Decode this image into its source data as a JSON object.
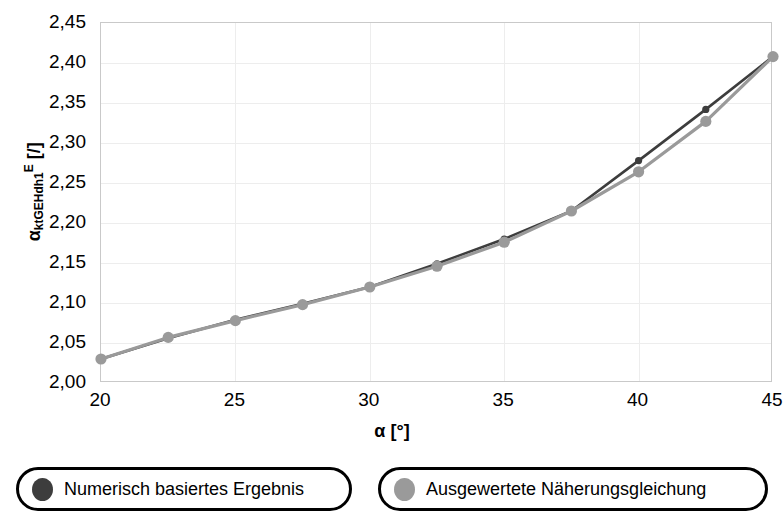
{
  "chart_data": {
    "type": "line",
    "title": "",
    "xlabel": "α [°]",
    "ylabel": "α_ktGEHdh1^E [/]",
    "ylabel_parts": {
      "base": "α",
      "sub": "ktGEHdh1",
      "sup": "E",
      "unit": "[/]"
    },
    "xlabel_parts": {
      "base": "α",
      "unit": "[°]"
    },
    "xlim": [
      20,
      45
    ],
    "ylim": [
      2.0,
      2.45
    ],
    "grid": true,
    "legend_position": "bottom",
    "x_ticks": [
      "20",
      "25",
      "30",
      "35",
      "40",
      "45"
    ],
    "x_tick_values": [
      20,
      25,
      30,
      35,
      40,
      45
    ],
    "y_ticks": [
      "2,00",
      "2,05",
      "2,10",
      "2,15",
      "2,20",
      "2,25",
      "2,30",
      "2,35",
      "2,40",
      "2,45"
    ],
    "y_tick_values": [
      2.0,
      2.05,
      2.1,
      2.15,
      2.2,
      2.25,
      2.3,
      2.35,
      2.4,
      2.45
    ],
    "x": [
      20,
      22.5,
      25,
      27.5,
      30,
      32.5,
      35,
      37.5,
      40,
      42.5,
      45
    ],
    "series": [
      {
        "name": "Numerisch basiertes Ergebnis",
        "color": "#3d3d3d",
        "marker": "circle",
        "values": [
          2.03,
          2.056,
          2.079,
          2.099,
          2.12,
          2.149,
          2.18,
          2.215,
          2.278,
          2.342,
          2.408
        ]
      },
      {
        "name": "Ausgewertete Näherungsgleichung",
        "color": "#9a9a9a",
        "marker": "circle",
        "values": [
          2.03,
          2.057,
          2.078,
          2.098,
          2.12,
          2.146,
          2.176,
          2.215,
          2.264,
          2.327,
          2.408
        ]
      }
    ]
  },
  "legend": {
    "items": [
      {
        "label": "Numerisch basiertes Ergebnis",
        "color": "#3d3d3d"
      },
      {
        "label": "Ausgewertete Näherungsgleichung",
        "color": "#9a9a9a"
      }
    ]
  }
}
